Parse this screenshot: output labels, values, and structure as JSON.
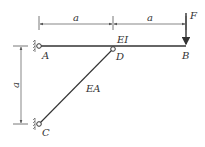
{
  "diagram": {
    "labels": {
      "dim_top_left": "a",
      "dim_top_right": "a",
      "dim_vertical": "a",
      "force": "F",
      "beam_stiffness": "EI",
      "rod_stiffness": "EA",
      "point_a": "A",
      "point_b": "B",
      "point_c": "C",
      "point_d": "D"
    },
    "colors": {
      "line": "#333333",
      "dimension": "#555555"
    }
  }
}
